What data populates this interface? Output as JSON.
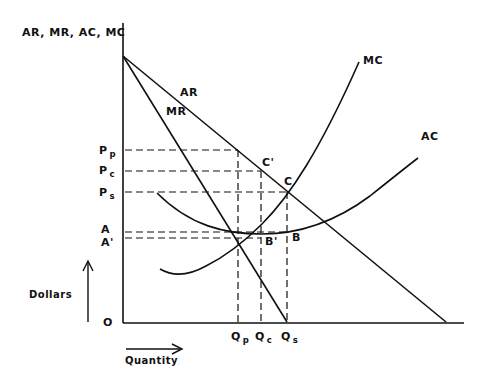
{
  "axes": {
    "y_title": "AR, MR, AC, MC",
    "y_unit_label": "Dollars",
    "x_unit_label": "Quantity",
    "origin": "O"
  },
  "curves": {
    "ar": "AR",
    "mr": "MR",
    "mc": "MC",
    "ac": "AC"
  },
  "price_levels": [
    {
      "main": "P",
      "sub": "p"
    },
    {
      "main": "P",
      "sub": "c"
    },
    {
      "main": "P",
      "sub": "s"
    },
    {
      "main": "A",
      "sub": ""
    },
    {
      "main": "A'",
      "sub": ""
    }
  ],
  "quantities": [
    {
      "main": "Q",
      "sub": "p"
    },
    {
      "main": "Q",
      "sub": "c"
    },
    {
      "main": "Q",
      "sub": "s"
    }
  ],
  "points": {
    "c_prime": "C'",
    "c": "C",
    "b_prime": "B'",
    "b": "B"
  },
  "colors": {
    "line": "#111111",
    "background": "#ffffff"
  }
}
